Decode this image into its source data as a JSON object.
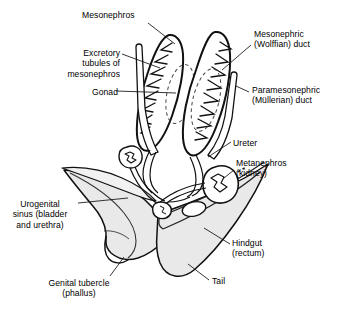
{
  "figure": {
    "type": "anatomical-diagram",
    "colors": {
      "ink": "#000000",
      "body_wall_fill": "#e8e8e8",
      "body_wall_fill_light": "#f2f2f2",
      "background": "#ffffff",
      "leader_line": "#000000"
    }
  },
  "labels": [
    {
      "id": "mesonephros",
      "name": "label-mesonephros",
      "lines": [
        "Mesonephros"
      ],
      "text": "Mesonephros",
      "align": "left",
      "x": 82,
      "y": 10
    },
    {
      "id": "excretory-tubules",
      "name": "label-excretory-tubules-of-mesonephros",
      "lines": [
        "Excretory",
        "tubules of",
        "mesonephros"
      ],
      "text": "Excretory\ntubules of\nmesonephros",
      "align": "right",
      "x": 58,
      "y": 48
    },
    {
      "id": "gonad",
      "name": "label-gonad",
      "lines": [
        "Gonad"
      ],
      "text": "Gonad",
      "align": "right",
      "x": 84,
      "y": 87
    },
    {
      "id": "mesonephric-duct",
      "name": "label-mesonephric-wolffian-duct",
      "lines": [
        "Mesonephric",
        "(Wolffian) duct"
      ],
      "text": "Mesonephric\n(Wolffian) duct",
      "align": "left",
      "x": 254,
      "y": 29
    },
    {
      "id": "paramesonephric-duct",
      "name": "label-paramesonephric-mullerian-duct",
      "lines": [
        "Paramesonephric",
        "(Müllerian) duct"
      ],
      "text": "Paramesonephric\n(Müllerian) duct",
      "align": "left",
      "x": 252,
      "y": 85
    },
    {
      "id": "ureter",
      "name": "label-ureter",
      "lines": [
        "Ureter"
      ],
      "text": "Ureter",
      "align": "left",
      "x": 233,
      "y": 138
    },
    {
      "id": "metanephros",
      "name": "label-metanephros-kidney",
      "lines": [
        "Metanephros",
        "(kidney)"
      ],
      "text": "Metanephros\n(kidney)",
      "align": "left",
      "x": 236,
      "y": 158
    },
    {
      "id": "urogenital-sinus",
      "name": "label-urogenital-sinus",
      "lines": [
        "Urogenital",
        "sinus (bladder",
        "and urethra)"
      ],
      "text": "Urogenital\nsinus (bladder\nand urethra)",
      "align": "center",
      "x": 8,
      "y": 199
    },
    {
      "id": "hindgut",
      "name": "label-hindgut-rectum",
      "lines": [
        "Hindgut",
        "(rectum)"
      ],
      "text": "Hindgut\n(rectum)",
      "align": "left",
      "x": 232,
      "y": 238
    },
    {
      "id": "genital-tubercle",
      "name": "label-genital-tubercle-phallus",
      "lines": [
        "Genital tubercle",
        "(phallus)"
      ],
      "text": "Genital tubercle\n(phallus)",
      "align": "center",
      "x": 48,
      "y": 278
    },
    {
      "id": "tail",
      "name": "label-tail",
      "lines": [
        "Tail"
      ],
      "text": "Tail",
      "align": "left",
      "x": 212,
      "y": 276
    }
  ],
  "structures": [
    {
      "id": "mesonephros-left",
      "name": "mesonephros-left"
    },
    {
      "id": "mesonephros-right",
      "name": "mesonephros-right"
    },
    {
      "id": "gonad-left",
      "name": "gonad-left"
    },
    {
      "id": "gonad-right",
      "name": "gonad-right"
    },
    {
      "id": "wolffian-duct-left",
      "name": "mesonephric-duct-left"
    },
    {
      "id": "wolffian-duct-right",
      "name": "mesonephric-duct-right"
    },
    {
      "id": "mullerian-duct-left",
      "name": "paramesonephric-duct-left"
    },
    {
      "id": "mullerian-duct-right",
      "name": "paramesonephric-duct-right"
    },
    {
      "id": "metanephros-left",
      "name": "metanephros-kidney-left"
    },
    {
      "id": "metanephros-right",
      "name": "metanephros-kidney-right"
    },
    {
      "id": "ureter-left",
      "name": "ureter-left"
    },
    {
      "id": "ureter-right",
      "name": "ureter-right"
    },
    {
      "id": "urogenital-sinus",
      "name": "urogenital-sinus-body"
    },
    {
      "id": "hindgut",
      "name": "hindgut-rectum-body"
    },
    {
      "id": "tail",
      "name": "tail-body"
    },
    {
      "id": "genital-tubercle",
      "name": "genital-tubercle-body"
    }
  ]
}
